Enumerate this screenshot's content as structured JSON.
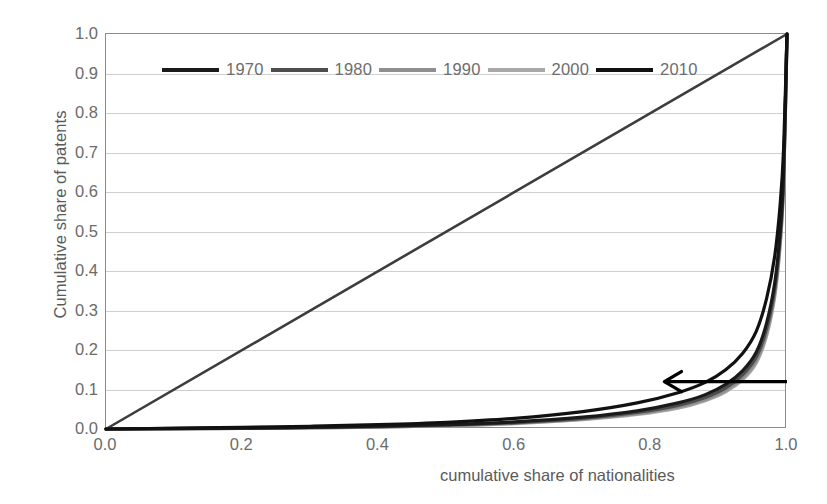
{
  "chart_data": {
    "type": "line",
    "title": "",
    "subtitle": "",
    "xlabel": "cumulative share of nationalities",
    "ylabel": "Cumulative share of patents",
    "xlim": [
      0.0,
      1.0
    ],
    "ylim": [
      0.0,
      1.0
    ],
    "xticks": [
      "0.0",
      "0.2",
      "0.4",
      "0.6",
      "0.8",
      "1.0"
    ],
    "xtick_values": [
      0.0,
      0.2,
      0.4,
      0.6,
      0.8,
      1.0
    ],
    "yticks": [
      "0.0",
      "0.1",
      "0.2",
      "0.3",
      "0.4",
      "0.5",
      "0.6",
      "0.7",
      "0.8",
      "0.9",
      "1.0"
    ],
    "ytick_values": [
      0.0,
      0.1,
      0.2,
      0.3,
      0.4,
      0.5,
      0.6,
      0.7,
      0.8,
      0.9,
      1.0
    ],
    "grid": "horizontal",
    "legend_position": "top-inside",
    "series": [
      {
        "name": "1970",
        "color": "#1a1a1a",
        "x": [
          0.0,
          0.1,
          0.2,
          0.3,
          0.4,
          0.5,
          0.6,
          0.7,
          0.78,
          0.84,
          0.88,
          0.91,
          0.935,
          0.955,
          0.97,
          0.982,
          0.99,
          0.995,
          1.0
        ],
        "y": [
          0.0,
          0.001,
          0.002,
          0.004,
          0.007,
          0.011,
          0.018,
          0.03,
          0.046,
          0.066,
          0.087,
          0.113,
          0.148,
          0.195,
          0.268,
          0.37,
          0.5,
          0.65,
          1.0
        ]
      },
      {
        "name": "1980",
        "color": "#4d4d4d",
        "x": [
          0.0,
          0.1,
          0.2,
          0.3,
          0.4,
          0.5,
          0.6,
          0.7,
          0.78,
          0.84,
          0.88,
          0.91,
          0.935,
          0.955,
          0.97,
          0.982,
          0.99,
          0.995,
          1.0
        ],
        "y": [
          0.0,
          0.001,
          0.002,
          0.004,
          0.006,
          0.01,
          0.016,
          0.027,
          0.042,
          0.06,
          0.08,
          0.104,
          0.138,
          0.183,
          0.254,
          0.356,
          0.488,
          0.64,
          1.0
        ]
      },
      {
        "name": "1990",
        "color": "#8f8f8f",
        "x": [
          0.0,
          0.1,
          0.2,
          0.3,
          0.4,
          0.5,
          0.6,
          0.7,
          0.78,
          0.84,
          0.88,
          0.91,
          0.935,
          0.955,
          0.97,
          0.982,
          0.99,
          0.995,
          1.0
        ],
        "y": [
          0.0,
          0.001,
          0.002,
          0.003,
          0.005,
          0.009,
          0.015,
          0.025,
          0.039,
          0.056,
          0.075,
          0.098,
          0.13,
          0.174,
          0.243,
          0.344,
          0.476,
          0.63,
          1.0
        ]
      },
      {
        "name": "2000",
        "color": "#a8a8a8",
        "x": [
          0.0,
          0.1,
          0.2,
          0.3,
          0.4,
          0.5,
          0.6,
          0.7,
          0.78,
          0.84,
          0.88,
          0.91,
          0.935,
          0.955,
          0.97,
          0.982,
          0.99,
          0.995,
          1.0
        ],
        "y": [
          0.0,
          0.001,
          0.002,
          0.003,
          0.005,
          0.008,
          0.014,
          0.024,
          0.037,
          0.053,
          0.072,
          0.094,
          0.125,
          0.168,
          0.236,
          0.336,
          0.468,
          0.624,
          1.0
        ]
      },
      {
        "name": "2010",
        "color": "#111111",
        "x": [
          0.0,
          0.1,
          0.2,
          0.3,
          0.4,
          0.5,
          0.6,
          0.7,
          0.78,
          0.84,
          0.88,
          0.91,
          0.935,
          0.955,
          0.97,
          0.982,
          0.99,
          0.995,
          1.0
        ],
        "y": [
          0.0,
          0.002,
          0.004,
          0.007,
          0.011,
          0.017,
          0.027,
          0.044,
          0.066,
          0.092,
          0.118,
          0.15,
          0.192,
          0.248,
          0.33,
          0.438,
          0.57,
          0.71,
          1.0
        ]
      },
      {
        "name": "equality-line",
        "color": "#3d3d3d",
        "x": [
          0.0,
          1.0
        ],
        "y": [
          0.0,
          1.0
        ]
      }
    ],
    "annotations": [
      {
        "name": "direction-arrow",
        "type": "arrow",
        "label": "",
        "from_x": 1.0,
        "from_y": 0.12,
        "to_x": 0.82,
        "to_y": 0.12,
        "color": "#000000"
      }
    ]
  },
  "axes": {
    "ylabel": "Cumulative share of patents",
    "xlabel": "cumulative share of nationalities",
    "yticks": [
      "1.0",
      "0.9",
      "0.8",
      "0.7",
      "0.6",
      "0.5",
      "0.4",
      "0.3",
      "0.2",
      "0.1",
      "0.0"
    ],
    "xticks": [
      "0.0",
      "0.2",
      "0.4",
      "0.6",
      "0.8",
      "1.0"
    ]
  },
  "legend": {
    "items": [
      {
        "label": "1970",
        "color": "#1a1a1a"
      },
      {
        "label": "1980",
        "color": "#4d4d4d"
      },
      {
        "label": "1990",
        "color": "#8f8f8f"
      },
      {
        "label": "2000",
        "color": "#a8a8a8"
      },
      {
        "label": "2010",
        "color": "#111111"
      }
    ]
  }
}
